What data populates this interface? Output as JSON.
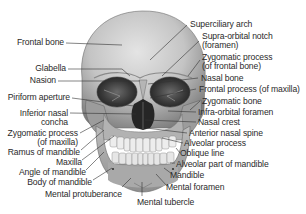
{
  "diagram": {
    "labels_left": [
      {
        "id": "frontal-bone",
        "text": "Frontal bone"
      },
      {
        "id": "glabella",
        "text": "Glabella"
      },
      {
        "id": "nasion",
        "text": "Nasion"
      },
      {
        "id": "piriform-aperture",
        "text": "Piriform aperture"
      },
      {
        "id": "inferior-nasal-concha",
        "line1": "Inferior nasal",
        "line2": "concha"
      },
      {
        "id": "zygomatic-process-maxilla",
        "line1": "Zygomatic process",
        "line2": "(of maxilla)"
      },
      {
        "id": "ramus-of-mandible",
        "text": "Ramus of mandible"
      },
      {
        "id": "maxilla",
        "text": "Maxilla"
      },
      {
        "id": "angle-of-mandible",
        "text": "Angle of mandible"
      },
      {
        "id": "body-of-mandible",
        "text": "Body of mandible"
      },
      {
        "id": "mental-protuberance",
        "text": "Mental protuberance"
      }
    ],
    "labels_right": [
      {
        "id": "superciliary-arch",
        "text": "Superciliary arch"
      },
      {
        "id": "supra-orbital-notch",
        "line1": "Supra-orbital notch",
        "line2": "(foramen)"
      },
      {
        "id": "zygomatic-process-frontal",
        "line1": "Zygomatic process",
        "line2": "(of frontal bone)"
      },
      {
        "id": "nasal-bone",
        "text": "Nasal bone"
      },
      {
        "id": "frontal-process-maxilla",
        "text": "Frontal process (of maxilla)"
      },
      {
        "id": "zygomatic-bone",
        "text": "Zygomatic bone"
      },
      {
        "id": "infra-orbital-foramen",
        "text": "Infra-orbital foramen"
      },
      {
        "id": "nasal-crest",
        "text": "Nasal crest"
      },
      {
        "id": "anterior-nasal-spine",
        "text": "Anterior nasal spine"
      },
      {
        "id": "alveolar-process",
        "text": "Alveolar process"
      },
      {
        "id": "oblique-line",
        "text": "Oblique line"
      },
      {
        "id": "alveolar-part-of-mandible",
        "text": "Alveolar part of mandible"
      },
      {
        "id": "mandible",
        "text": "Mandible"
      },
      {
        "id": "mental-foramen",
        "text": "Mental foramen"
      }
    ],
    "labels_bottom": [
      {
        "id": "mental-tubercle",
        "text": "Mental tubercle"
      }
    ],
    "colors": {
      "bone_light": "#d9d9d9",
      "bone_mid": "#a8a8a8",
      "bone_dark": "#5a5a5a",
      "cavity": "#2b2b2b",
      "leader_line": "#333333",
      "text": "#2a2a2a"
    }
  }
}
